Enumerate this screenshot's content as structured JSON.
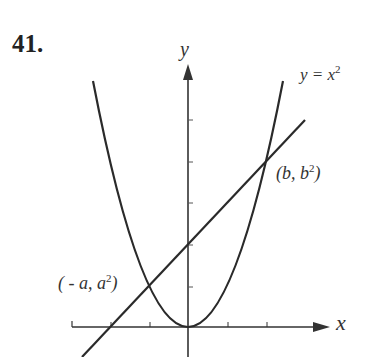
{
  "problem_number": "41.",
  "axes": {
    "x_label": "x",
    "y_label": "y",
    "origin_px": [
      188,
      327
    ],
    "x_ticks_px": [
      72,
      111,
      150,
      228,
      267
    ],
    "y_ticks_px": [
      120,
      162,
      203,
      245,
      287
    ]
  },
  "curve": {
    "label_lhs": "y = x",
    "label_exp": "2",
    "equation": "y = x^2"
  },
  "points": {
    "right": {
      "label_pre": "(b, b",
      "label_exp": "2",
      "label_post": ")",
      "px": [
        265,
        164
      ]
    },
    "left": {
      "label_pre": "( - a, a",
      "label_exp": "2",
      "label_post": ")",
      "px": [
        150,
        287
      ]
    }
  },
  "colors": {
    "ink": "#2a2a2a",
    "background": "#ffffff"
  }
}
